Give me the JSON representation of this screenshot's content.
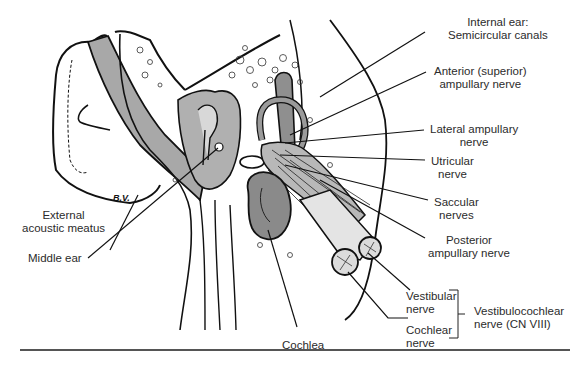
{
  "figure": {
    "artist_signature": "B.V.",
    "colors": {
      "line": "#111111",
      "shade": "#9a9a9a",
      "light_shade": "#c4c4c4",
      "label_text": "#2b2b2b",
      "background": "#ffffff"
    }
  },
  "labels": {
    "internal_ear": {
      "line1": "Internal ear:",
      "line2": "Semicircular canals"
    },
    "anterior_ampullary": {
      "line1": "Anterior (superior)",
      "line2": "ampullary nerve"
    },
    "lateral_ampullary": {
      "line1": "Lateral ampullary",
      "line2": "nerve"
    },
    "utricular": {
      "line1": "Utricular",
      "line2": "nerve"
    },
    "saccular": {
      "line1": "Saccular",
      "line2": "nerves"
    },
    "posterior_ampullary": {
      "line1": "Posterior",
      "line2": "ampullary nerve"
    },
    "vestibular": {
      "line1": "Vestibular",
      "line2": "nerve"
    },
    "cochlear_nerve": {
      "line1": "Cochlear",
      "line2": "nerve"
    },
    "vestibulocochlear": {
      "line1": "Vestibulocochlear",
      "line2": "nerve (CN VIII)"
    },
    "external_acoustic_meatus": {
      "line1": "External",
      "line2": "acoustic meatus"
    },
    "middle_ear": {
      "line1": "Middle ear"
    },
    "cochlea": {
      "line1": "Cochlea"
    }
  }
}
